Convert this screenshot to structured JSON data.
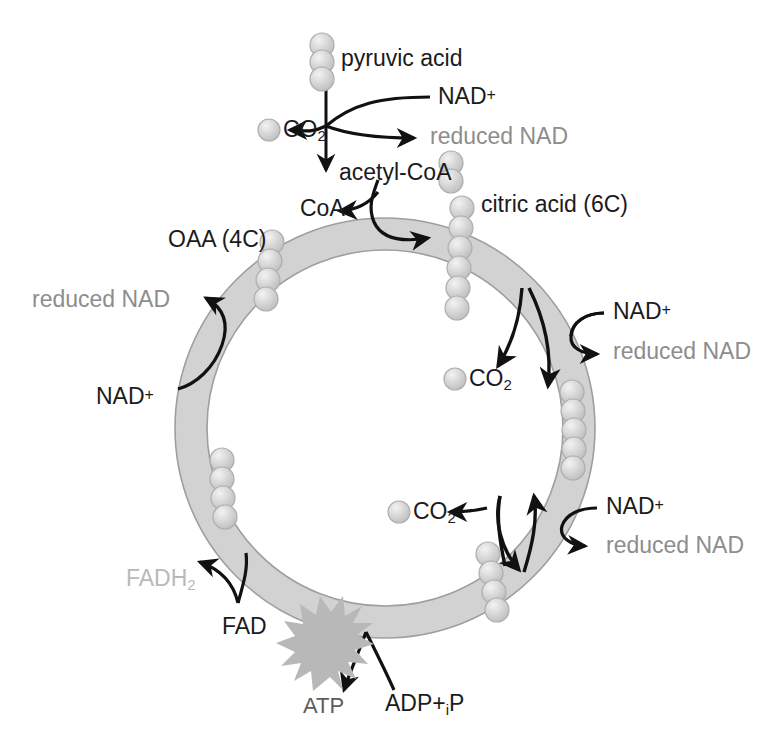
{
  "diagram": {
    "ring": {
      "center_x": 385,
      "center_y": 428,
      "outer_radius": 210,
      "inner_radius": 178,
      "fill_color": "#d2d2d2",
      "stroke_color": "#9a9a9a"
    },
    "colors": {
      "text_black": "#1b1b1b",
      "text_gray": "#8d8d8d",
      "text_faint": "#b9b9b9",
      "sphere": "#cfcfcf",
      "ring": "#d2d2d2",
      "atp_star": "#b5b5b5"
    },
    "labels": {
      "pyruvic_acid": "pyruvic acid",
      "nad_plus_top": "NAD",
      "nad_plus_sign": "+",
      "reduced_nad_top": "reduced NAD",
      "co2_top": "CO",
      "co2_sub": "2",
      "acetyl_coa": "acetyl-CoA",
      "coa": "CoA",
      "citric_acid": "citric acid (6C)",
      "oaa": "OAA (4C)",
      "reduced_nad_left": "reduced NAD",
      "nad_plus_left": "NAD",
      "nad_plus_right_upper": "NAD",
      "reduced_nad_right_upper": "reduced NAD",
      "co2_mid_right": "CO",
      "co2_lower_mid": "CO",
      "nad_plus_right_lower": "NAD",
      "reduced_nad_right_lower": "reduced NAD",
      "fadh2": "FADH",
      "fadh2_sub": "2",
      "fad": "FAD",
      "atp": "ATP",
      "adp": "ADP+",
      "adp_sub": "i",
      "adp_tail": "P"
    },
    "carbon_groups": [
      {
        "name": "pyruvic-acid-carbons",
        "count": 3,
        "compound": "pyruvic acid (3C)"
      },
      {
        "name": "acetyl-coa-carbons",
        "count": 2,
        "compound": "acetyl-CoA (2C)"
      },
      {
        "name": "citric-acid-carbons",
        "count": 6,
        "compound": "citric acid (6C)"
      },
      {
        "name": "oaa-carbons",
        "count": 4,
        "compound": "oxaloacetic acid (4C)"
      },
      {
        "name": "five-carbon-carbons",
        "count": 5,
        "compound": "5C intermediate"
      },
      {
        "name": "four-carbon-right-carbons",
        "count": 4,
        "compound": "4C intermediate"
      },
      {
        "name": "four-carbon-left-carbons",
        "count": 4,
        "compound": "4C intermediate"
      },
      {
        "name": "co2-top-carbon",
        "count": 1,
        "compound": "carbon dioxide"
      },
      {
        "name": "co2-mid-right-carbon",
        "count": 1,
        "compound": "carbon dioxide"
      },
      {
        "name": "co2-lower-mid-carbon",
        "count": 1,
        "compound": "carbon dioxide"
      }
    ]
  }
}
